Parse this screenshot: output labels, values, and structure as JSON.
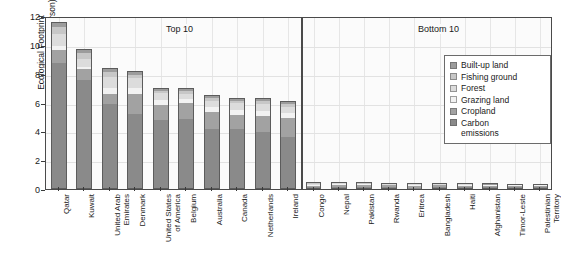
{
  "chart_data": {
    "type": "bar",
    "subtype": "stacked-bar",
    "title": "",
    "xlabel": "",
    "ylabel": "Ecological Footprint\n(global hectares per person)",
    "ylim": [
      0,
      12
    ],
    "yticks": [
      0,
      2,
      4,
      6,
      8,
      10,
      12
    ],
    "grid": true,
    "legend_position": "right",
    "panels": [
      {
        "name": "top10",
        "label": "Top 10"
      },
      {
        "name": "bottom10",
        "label": "Bottom 10"
      }
    ],
    "series": [
      {
        "name": "Carbon emissions",
        "color": "#8a8a8a"
      },
      {
        "name": "Cropland",
        "color": "#a2a2a2"
      },
      {
        "name": "Grazing land",
        "color": "#f2f2f2"
      },
      {
        "name": "Forest",
        "color": "#dcdcdc"
      },
      {
        "name": "Fishing ground",
        "color": "#c7c7c7"
      },
      {
        "name": "Built-up land",
        "color": "#9c9c9c"
      }
    ],
    "categories": [
      "Qatar",
      "Kuwait",
      "United Arab\nEmirates",
      "Denmark",
      "United States\nof America",
      "Belgium",
      "Australia",
      "Canada",
      "Netherlands",
      "Ireland",
      "Congo",
      "Nepal",
      "Pakistan",
      "Rwanda",
      "Eritrea",
      "Bangladesh",
      "Haiti",
      "Afghanistan",
      "Timor-Leste",
      "Palestinian\nTerritory"
    ],
    "values": [
      {
        "category": "Qatar",
        "panel": "top10",
        "total": 11.6,
        "segments": [
          8.8,
          0.9,
          0.25,
          0.85,
          0.5,
          0.3
        ]
      },
      {
        "category": "Kuwait",
        "panel": "top10",
        "total": 9.7,
        "segments": [
          7.6,
          0.75,
          0.2,
          0.55,
          0.4,
          0.2
        ]
      },
      {
        "category": "United Arab\nEmirates",
        "panel": "top10",
        "total": 8.4,
        "segments": [
          5.9,
          0.75,
          0.4,
          0.75,
          0.4,
          0.2
        ]
      },
      {
        "category": "Denmark",
        "panel": "top10",
        "total": 8.2,
        "segments": [
          5.2,
          1.45,
          0.4,
          0.7,
          0.25,
          0.2
        ]
      },
      {
        "category": "United States\nof America",
        "panel": "top10",
        "total": 7.0,
        "segments": [
          4.8,
          1.1,
          0.35,
          0.45,
          0.15,
          0.15
        ]
      },
      {
        "category": "Belgium",
        "panel": "top10",
        "total": 7.0,
        "segments": [
          4.9,
          1.1,
          0.3,
          0.35,
          0.2,
          0.15
        ]
      },
      {
        "category": "Australia",
        "panel": "top10",
        "total": 6.5,
        "segments": [
          4.2,
          1.2,
          0.35,
          0.45,
          0.15,
          0.15
        ]
      },
      {
        "category": "Canada",
        "panel": "top10",
        "total": 6.3,
        "segments": [
          4.2,
          1.0,
          0.3,
          0.5,
          0.15,
          0.15
        ]
      },
      {
        "category": "Netherlands",
        "panel": "top10",
        "total": 6.3,
        "segments": [
          4.0,
          1.1,
          0.35,
          0.5,
          0.2,
          0.15
        ]
      },
      {
        "category": "Ireland",
        "panel": "top10",
        "total": 6.1,
        "segments": [
          3.6,
          1.35,
          0.35,
          0.45,
          0.2,
          0.15
        ]
      },
      {
        "category": "Congo",
        "panel": "bottom10",
        "total": 0.5,
        "segments": [
          0.08,
          0.14,
          0.08,
          0.12,
          0.05,
          0.03
        ]
      },
      {
        "category": "Nepal",
        "panel": "bottom10",
        "total": 0.5,
        "segments": [
          0.1,
          0.18,
          0.07,
          0.09,
          0.03,
          0.03
        ]
      },
      {
        "category": "Pakistan",
        "panel": "bottom10",
        "total": 0.48,
        "segments": [
          0.12,
          0.2,
          0.06,
          0.05,
          0.02,
          0.03
        ]
      },
      {
        "category": "Rwanda",
        "panel": "bottom10",
        "total": 0.45,
        "segments": [
          0.06,
          0.2,
          0.07,
          0.07,
          0.02,
          0.03
        ]
      },
      {
        "category": "Eritrea",
        "panel": "bottom10",
        "total": 0.45,
        "segments": [
          0.05,
          0.13,
          0.14,
          0.08,
          0.02,
          0.03
        ]
      },
      {
        "category": "Bangladesh",
        "panel": "bottom10",
        "total": 0.43,
        "segments": [
          0.12,
          0.18,
          0.04,
          0.04,
          0.02,
          0.03
        ]
      },
      {
        "category": "Haiti",
        "panel": "bottom10",
        "total": 0.42,
        "segments": [
          0.08,
          0.17,
          0.06,
          0.06,
          0.02,
          0.03
        ]
      },
      {
        "category": "Afghanistan",
        "panel": "bottom10",
        "total": 0.4,
        "segments": [
          0.06,
          0.17,
          0.07,
          0.05,
          0.02,
          0.03
        ]
      },
      {
        "category": "Timor-Leste",
        "panel": "bottom10",
        "total": 0.38,
        "segments": [
          0.06,
          0.16,
          0.06,
          0.05,
          0.02,
          0.03
        ]
      },
      {
        "category": "Palestinian\nTerritory",
        "panel": "bottom10",
        "total": 0.38,
        "segments": [
          0.09,
          0.15,
          0.05,
          0.04,
          0.02,
          0.03
        ]
      }
    ]
  }
}
